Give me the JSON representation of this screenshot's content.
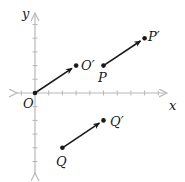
{
  "diagram": {
    "title": "",
    "axes": {
      "x_label": "x",
      "y_label": "y",
      "origin_label": "O",
      "x_ticks": [
        -1,
        1,
        2,
        3,
        4,
        5,
        6,
        7,
        8,
        9
      ],
      "y_ticks": [
        -5,
        -4,
        -3,
        -2,
        -1,
        1,
        2,
        3,
        4,
        5
      ],
      "axis_color": "#b8b8b8"
    },
    "translation_vector": [
      3,
      2
    ],
    "arrows": [
      {
        "from_label": "O",
        "to_label": "O′",
        "from": [
          0,
          0
        ],
        "to": [
          3,
          2
        ]
      },
      {
        "from_label": "P",
        "to_label": "P′",
        "from": [
          5,
          2
        ],
        "to": [
          8,
          4
        ]
      },
      {
        "from_label": "Q",
        "to_label": "Q′",
        "from": [
          2,
          -4
        ],
        "to": [
          5,
          -2
        ]
      }
    ],
    "labels": {
      "O": "O",
      "O_prime": "O′",
      "P": "P",
      "P_prime": "P′",
      "Q": "Q",
      "Q_prime": "Q′"
    },
    "arrow_color": "#1a1a1a"
  }
}
